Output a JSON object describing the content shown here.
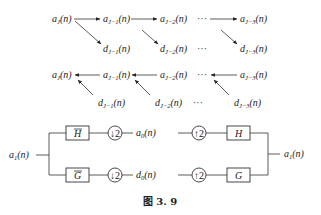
{
  "caption": "图 3. 9",
  "decomposition": {
    "approx": [
      {
        "base": "a",
        "sub": "J",
        "arg": "(n)"
      },
      {
        "base": "a",
        "sub": "J−1",
        "arg": "(n)"
      },
      {
        "base": "a",
        "sub": "J−2",
        "arg": "(n)"
      },
      {
        "base": "a",
        "sub": "J−3",
        "arg": "(n)"
      }
    ],
    "detail": [
      {
        "base": "d",
        "sub": "J−1",
        "arg": "(n)"
      },
      {
        "base": "d",
        "sub": "J−2",
        "arg": "(n)"
      },
      {
        "base": "d",
        "sub": "J−3",
        "arg": "(n)"
      }
    ],
    "ellipsis": "···"
  },
  "reconstruction": {
    "approx": [
      {
        "base": "a",
        "sub": "J",
        "arg": "(n)"
      },
      {
        "base": "a",
        "sub": "J−1",
        "arg": "(n)"
      },
      {
        "base": "a",
        "sub": "J−2",
        "arg": "(n)"
      },
      {
        "base": "a",
        "sub": "J−3",
        "arg": "(n)"
      }
    ],
    "detail": [
      {
        "base": "d",
        "sub": "J−1",
        "arg": "(n)"
      },
      {
        "base": "d",
        "sub": "J−2",
        "arg": "(n)"
      },
      {
        "base": "d",
        "sub": "J−3",
        "arg": "(n)"
      }
    ],
    "ellipsis": "···"
  },
  "filterbank": {
    "input": {
      "base": "a",
      "sub": "1",
      "arg": "(n)"
    },
    "output": {
      "base": "a",
      "sub": "1",
      "arg": "(n)"
    },
    "a0": {
      "base": "a",
      "sub": "0",
      "arg": "(n)"
    },
    "d0": {
      "base": "d",
      "sub": "0",
      "arg": "(n)"
    },
    "analysis_low": "H",
    "analysis_high": "G",
    "synthesis_low": "H",
    "synthesis_high": "G",
    "down": "↓2",
    "up": "↑2"
  }
}
